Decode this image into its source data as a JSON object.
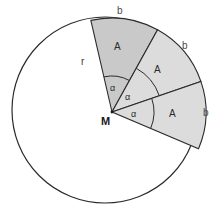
{
  "figure": {
    "colors": {
      "stroke": "#2b2b2b",
      "sector_fill_dark": "#c9c9c9",
      "sector_fill_light": "#dcdcdc",
      "background": "#ffffff",
      "label": "#1a1a1a"
    },
    "geometry": {
      "center_x": 112,
      "center_y": 112,
      "radius": 94,
      "sector_count": 3,
      "sector_angle_deg": 42,
      "start_angle_deg": -103,
      "angle_arc_radii": [
        36,
        50,
        42
      ]
    },
    "labels": {
      "center_point": "M",
      "radius": "r",
      "arc": "b",
      "area": "A",
      "angle": "α"
    },
    "arc_labels": [
      {
        "text": "b",
        "x": 117,
        "y": 6
      },
      {
        "text": "b",
        "x": 182,
        "y": 41
      },
      {
        "text": "b",
        "x": 203,
        "y": 108
      }
    ],
    "area_labels": [
      {
        "text": "A",
        "x": 114,
        "y": 42
      },
      {
        "text": "A",
        "x": 154,
        "y": 65
      },
      {
        "text": "A",
        "x": 169,
        "y": 109
      }
    ],
    "angle_labels": [
      {
        "text": "α",
        "x": 110,
        "y": 84
      },
      {
        "text": "α",
        "x": 125,
        "y": 93
      },
      {
        "text": "α",
        "x": 131,
        "y": 110
      }
    ],
    "radius_label": {
      "text": "r",
      "x": 81,
      "y": 57
    },
    "center_label": {
      "text": "M",
      "x": 101,
      "y": 116
    }
  }
}
